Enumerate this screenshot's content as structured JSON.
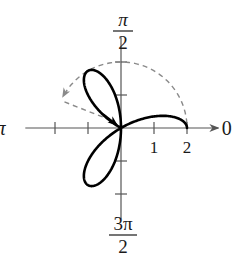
{
  "chart_data": {
    "type": "polar",
    "title": "",
    "equation_form": "r = 2cos(3θ)",
    "theta_range": [
      0,
      2.618
    ],
    "r_max": 2,
    "axis_labels": {
      "right": "0",
      "top_numerator": "π",
      "top_denominator": "2",
      "left": "π",
      "bottom_numerator": "3π",
      "bottom_denominator": "2"
    },
    "tick_labels": [
      {
        "value": 1,
        "label": "1"
      },
      {
        "value": 2,
        "label": "2"
      }
    ],
    "ticks_per_side": 2,
    "dashed_arc": {
      "radius": 2,
      "start_deg": 4,
      "end_deg": 152
    },
    "dashed_line": {
      "from_deg": 152,
      "from_r": 2,
      "to_r": 0.15
    }
  },
  "layout": {
    "origin_x": 121,
    "origin_y": 128,
    "unit_px": 33
  }
}
